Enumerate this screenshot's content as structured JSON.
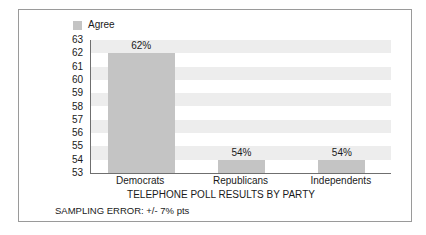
{
  "legend": {
    "swatch_icon": "legend-swatch-icon",
    "label": "Agree",
    "color": "#c4c4c4"
  },
  "chart_data": {
    "type": "bar",
    "title": "",
    "xlabel": "TELEPHONE POLL RESULTS BY PARTY",
    "ylabel": "",
    "categories": [
      "Democrats",
      "Republicans",
      "Independents"
    ],
    "values": [
      62,
      54,
      54
    ],
    "data_labels": [
      "62%",
      "54%",
      "54%"
    ],
    "ylim": [
      53,
      63
    ],
    "ytick_labels": [
      "63",
      "62",
      "61",
      "60",
      "59",
      "58",
      "57",
      "56",
      "55",
      "54",
      "53"
    ],
    "ytick_values": [
      63,
      62,
      61,
      60,
      59,
      58,
      57,
      56,
      55,
      54,
      53
    ],
    "grid": "alternating-horizontal-bands",
    "legend_position": "top-left",
    "series": [
      {
        "name": "Agree",
        "values": [
          62,
          54,
          54
        ],
        "color": "#c4c4c4"
      }
    ],
    "annotations": [
      "SAMPLING ERROR: +/- 7% pts"
    ]
  },
  "footnote": "SAMPLING ERROR: +/- 7% pts",
  "colors": {
    "bar": "#c4c4c4",
    "band": "#ededed",
    "axis": "#6f6f6f",
    "frame": "#9a9a9a",
    "text": "#1a1a1a"
  }
}
